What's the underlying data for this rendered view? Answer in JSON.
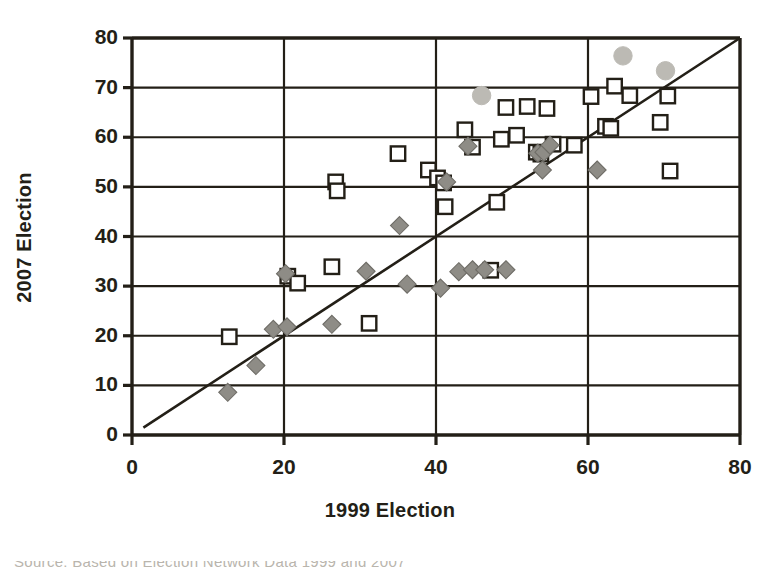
{
  "figure": {
    "background_color": "#ffffff",
    "ink_color": "#231f17"
  },
  "axes": {
    "y_title": "2007 Election",
    "x_title": "1999 Election",
    "x_ticks": [
      "0",
      "20",
      "40",
      "60",
      "80"
    ],
    "y_ticks": [
      "0",
      "10",
      "20",
      "30",
      "40",
      "50",
      "60",
      "70",
      "80"
    ]
  },
  "caption": {
    "text": "Source: Based on Election Network Data 1999 and 2007"
  },
  "chart_data": {
    "type": "scatter",
    "title": "",
    "xlabel": "1999 Election",
    "ylabel": "2007 Election",
    "xlim": [
      0,
      80
    ],
    "ylim": [
      0,
      80
    ],
    "xticks": [
      0,
      20,
      40,
      60,
      80
    ],
    "yticks": [
      0,
      10,
      20,
      30,
      40,
      50,
      60,
      70,
      80
    ],
    "grid": true,
    "grid_axis": "both",
    "legend": "none",
    "annotations": [
      {
        "type": "reference_line",
        "description": "45-degree identity line y = x",
        "from": [
          1.5,
          1.5
        ],
        "to": [
          80,
          80
        ],
        "color": "#231f17"
      }
    ],
    "series": [
      {
        "name": "open-square",
        "marker": "square-open",
        "color": "#ffffff",
        "edge_color": "#231f17",
        "points": [
          [
            12.8,
            19.8
          ],
          [
            20.5,
            32.0
          ],
          [
            21.8,
            30.6
          ],
          [
            26.3,
            33.9
          ],
          [
            26.8,
            51.0
          ],
          [
            27.0,
            49.2
          ],
          [
            31.2,
            22.5
          ],
          [
            35.0,
            56.7
          ],
          [
            39.0,
            53.4
          ],
          [
            40.2,
            51.8
          ],
          [
            41.0,
            50.8
          ],
          [
            41.2,
            46.0
          ],
          [
            43.8,
            61.5
          ],
          [
            44.8,
            58.0
          ],
          [
            47.2,
            33.2
          ],
          [
            48.0,
            46.9
          ],
          [
            48.6,
            59.6
          ],
          [
            49.2,
            66.0
          ],
          [
            50.6,
            60.4
          ],
          [
            52.0,
            66.2
          ],
          [
            53.2,
            57.0
          ],
          [
            53.8,
            56.6
          ],
          [
            54.6,
            65.8
          ],
          [
            55.4,
            58.6
          ],
          [
            58.2,
            58.4
          ],
          [
            60.4,
            68.2
          ],
          [
            62.3,
            62.2
          ],
          [
            63.0,
            61.8
          ],
          [
            63.5,
            70.3
          ],
          [
            65.5,
            68.4
          ],
          [
            69.5,
            63.0
          ],
          [
            70.5,
            68.3
          ],
          [
            70.8,
            53.2
          ]
        ]
      },
      {
        "name": "gray-diamond",
        "marker": "diamond-filled",
        "color": "#8e8c86",
        "edge_color": "#6f6d67",
        "points": [
          [
            12.6,
            8.6
          ],
          [
            16.3,
            14.0
          ],
          [
            18.6,
            21.3
          ],
          [
            20.4,
            21.8
          ],
          [
            20.2,
            32.5
          ],
          [
            26.3,
            22.3
          ],
          [
            30.8,
            33.0
          ],
          [
            35.2,
            42.2
          ],
          [
            36.2,
            30.4
          ],
          [
            40.6,
            29.6
          ],
          [
            41.4,
            51.0
          ],
          [
            43.0,
            32.9
          ],
          [
            44.2,
            58.2
          ],
          [
            44.8,
            33.3
          ],
          [
            46.4,
            33.3
          ],
          [
            49.2,
            33.3
          ],
          [
            53.4,
            56.8
          ],
          [
            54.0,
            53.4
          ],
          [
            54.2,
            57.0
          ],
          [
            55.0,
            58.4
          ],
          [
            61.2,
            53.4
          ]
        ]
      },
      {
        "name": "light-gray-circle",
        "marker": "circle-filled",
        "color": "#bcbab4",
        "edge_color": "#bcbab4",
        "points": [
          [
            46.0,
            68.4
          ],
          [
            64.6,
            76.4
          ],
          [
            70.2,
            73.4
          ]
        ]
      }
    ]
  }
}
